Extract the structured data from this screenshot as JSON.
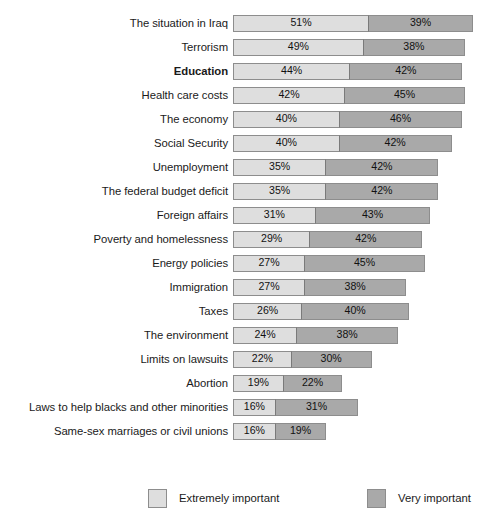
{
  "chart_data": {
    "type": "bar",
    "orientation": "horizontal",
    "stacked": true,
    "title": "",
    "subtitle": "",
    "xlabel": "",
    "ylabel": "",
    "grid": false,
    "xlim": [
      0,
      100
    ],
    "axis_visible": false,
    "px_per_percent": 2.667,
    "plot_left_px": 238,
    "legend": {
      "position": "bottom",
      "entries": [
        {
          "name": "Extremely important",
          "color": "#dedede",
          "swatch": "light"
        },
        {
          "name": "Very important",
          "color": "#a9a9a9",
          "swatch": "dark"
        }
      ]
    },
    "series": [
      {
        "name": "Extremely important",
        "color": "#dedede"
      },
      {
        "name": "Very important",
        "color": "#a9a9a9"
      }
    ],
    "categories": [
      "The situation in Iraq",
      "Terrorism",
      "Education",
      "Health care costs",
      "The economy",
      "Social Security",
      "Unemployment",
      "The federal budget deficit",
      "Foreign affairs",
      "Poverty and homelessness",
      "Energy policies",
      "Immigration",
      "Taxes",
      "The environment",
      "Limits on lawsuits",
      "Abortion",
      "Laws to help blacks and other minorities",
      "Same-sex marriages or civil unions"
    ],
    "rows": [
      {
        "label": "The situation in Iraq",
        "emphasis": false,
        "extremely": 51,
        "very": 39,
        "extremely_label": "51%",
        "very_label": "39%",
        "total": 90
      },
      {
        "label": "Terrorism",
        "emphasis": false,
        "extremely": 49,
        "very": 38,
        "extremely_label": "49%",
        "very_label": "38%",
        "total": 87
      },
      {
        "label": "Education",
        "emphasis": true,
        "extremely": 44,
        "very": 42,
        "extremely_label": "44%",
        "very_label": "42%",
        "total": 86
      },
      {
        "label": "Health care costs",
        "emphasis": false,
        "extremely": 42,
        "very": 45,
        "extremely_label": "42%",
        "very_label": "45%",
        "total": 87
      },
      {
        "label": "The economy",
        "emphasis": false,
        "extremely": 40,
        "very": 46,
        "extremely_label": "40%",
        "very_label": "46%",
        "total": 86
      },
      {
        "label": "Social Security",
        "emphasis": false,
        "extremely": 40,
        "very": 42,
        "extremely_label": "40%",
        "very_label": "42%",
        "total": 82
      },
      {
        "label": "Unemployment",
        "emphasis": false,
        "extremely": 35,
        "very": 42,
        "extremely_label": "35%",
        "very_label": "42%",
        "total": 77
      },
      {
        "label": "The federal budget deficit",
        "emphasis": false,
        "extremely": 35,
        "very": 42,
        "extremely_label": "35%",
        "very_label": "42%",
        "total": 77
      },
      {
        "label": "Foreign affairs",
        "emphasis": false,
        "extremely": 31,
        "very": 43,
        "extremely_label": "31%",
        "very_label": "43%",
        "total": 74
      },
      {
        "label": "Poverty and homelessness",
        "emphasis": false,
        "extremely": 29,
        "very": 42,
        "extremely_label": "29%",
        "very_label": "42%",
        "total": 71
      },
      {
        "label": "Energy policies",
        "emphasis": false,
        "extremely": 27,
        "very": 45,
        "extremely_label": "27%",
        "very_label": "45%",
        "total": 72
      },
      {
        "label": "Immigration",
        "emphasis": false,
        "extremely": 27,
        "very": 38,
        "extremely_label": "27%",
        "very_label": "38%",
        "total": 65
      },
      {
        "label": "Taxes",
        "emphasis": false,
        "extremely": 26,
        "very": 40,
        "extremely_label": "26%",
        "very_label": "40%",
        "total": 66
      },
      {
        "label": "The environment",
        "emphasis": false,
        "extremely": 24,
        "very": 38,
        "extremely_label": "24%",
        "very_label": "38%",
        "total": 62
      },
      {
        "label": "Limits on lawsuits",
        "emphasis": false,
        "extremely": 22,
        "very": 30,
        "extremely_label": "22%",
        "very_label": "30%",
        "total": 52
      },
      {
        "label": "Abortion",
        "emphasis": false,
        "extremely": 19,
        "very": 22,
        "extremely_label": "19%",
        "very_label": "22%",
        "total": 41
      },
      {
        "label": "Laws to help blacks and other minorities",
        "emphasis": false,
        "extremely": 16,
        "very": 31,
        "extremely_label": "16%",
        "very_label": "31%",
        "total": 47
      },
      {
        "label": "Same-sex marriages or civil unions",
        "emphasis": false,
        "extremely": 16,
        "very": 19,
        "extremely_label": "16%",
        "very_label": "19%",
        "total": 35
      }
    ]
  }
}
